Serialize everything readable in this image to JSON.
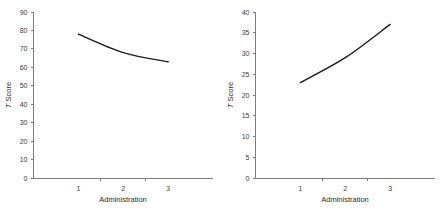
{
  "figure": {
    "background_color": "#ffffff",
    "axis_color": "#7d7d7d",
    "line_color": "#1a1a1a",
    "panel_count": 2
  },
  "chart_data": [
    {
      "type": "line",
      "panel": "left",
      "title": "",
      "xlabel": "Administration",
      "ylabel": "T Score",
      "ylabel_parts": {
        "italic": "T",
        "plain": " Score"
      },
      "categories": [
        "1",
        "2",
        "3"
      ],
      "x": [
        1,
        2,
        3
      ],
      "values": [
        78,
        68,
        63
      ],
      "ylim": [
        0,
        90
      ],
      "yticks": [
        0,
        10,
        20,
        30,
        40,
        50,
        60,
        70,
        80,
        90
      ],
      "ytick_labels": [
        "0",
        "10",
        "20",
        "30",
        "40",
        "50",
        "60",
        "70",
        "80",
        "90"
      ],
      "xtick_labels": [
        "1",
        "2",
        "3"
      ],
      "grid": false,
      "legend": "none",
      "trend": "decreasing"
    },
    {
      "type": "line",
      "panel": "right",
      "title": "",
      "xlabel": "Administration",
      "ylabel": "T Score",
      "ylabel_parts": {
        "italic": "T",
        "plain": " Score"
      },
      "categories": [
        "1",
        "2",
        "3"
      ],
      "x": [
        1,
        2,
        3
      ],
      "values": [
        23,
        29,
        37
      ],
      "ylim": [
        0,
        40
      ],
      "yticks": [
        0,
        5,
        10,
        15,
        20,
        25,
        30,
        35,
        40
      ],
      "ytick_labels": [
        "0",
        "5",
        "10",
        "15",
        "20",
        "25",
        "30",
        "35",
        "40"
      ],
      "xtick_labels": [
        "1",
        "2",
        "3"
      ],
      "grid": false,
      "legend": "none",
      "trend": "increasing"
    }
  ]
}
